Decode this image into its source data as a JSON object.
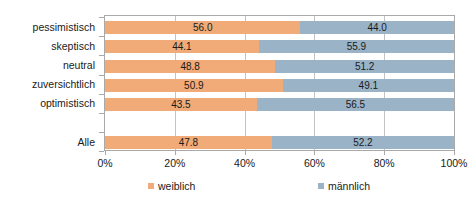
{
  "title_remnant": "",
  "chart_data": {
    "type": "bar",
    "subtype": "stacked-horizontal-100-percent",
    "title": "",
    "xlabel": "",
    "ylabel": "",
    "xlim": [
      0,
      100
    ],
    "xticks": [
      0,
      20,
      40,
      60,
      80,
      100
    ],
    "xtick_labels": [
      "0%",
      "20%",
      "40%",
      "60%",
      "80%",
      "100%"
    ],
    "grid": true,
    "grid_axis": "x",
    "legend_position": "bottom",
    "categories": [
      "pessimistisch",
      "skeptisch",
      "neutral",
      "zuversichtlich",
      "optimistisch",
      "Alle"
    ],
    "series": [
      {
        "name": "weiblich",
        "color": "#F0AB78",
        "values": [
          56.0,
          44.1,
          48.8,
          50.9,
          43.5,
          47.8
        ],
        "labels": [
          "56.0",
          "44.1",
          "48.8",
          "50.9",
          "43.5",
          "47.8"
        ]
      },
      {
        "name": "männlich",
        "color": "#9BB3C6",
        "values": [
          44.0,
          55.9,
          51.2,
          49.1,
          56.5,
          52.2
        ],
        "labels": [
          "44.0",
          "55.9",
          "51.2",
          "49.1",
          "56.5",
          "52.2"
        ]
      }
    ]
  },
  "legend": {
    "items": [
      {
        "label": "weiblich",
        "color": "#F0AB78"
      },
      {
        "label": "männlich",
        "color": "#9BB3C6"
      }
    ]
  },
  "colors": {
    "female": "#F0AB78",
    "male": "#9BB3C6",
    "axis": "#a9a9a9",
    "gridline": "#c3c3c3",
    "text": "#1a1a1a",
    "background": "#ffffff"
  }
}
